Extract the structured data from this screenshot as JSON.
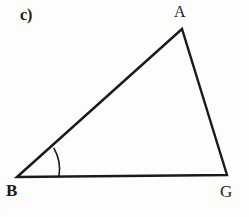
{
  "figure": {
    "part_label": "c)",
    "shape_name": "triangle",
    "background_color": "#fdfdfc",
    "stroke_color": "#1a1a1a",
    "stroke_width": 2.4,
    "arc_stroke_width": 1.6,
    "vertices": [
      {
        "name": "A",
        "label": "A",
        "x": 182,
        "y": 29
      },
      {
        "name": "B",
        "label": "B",
        "x": 17,
        "y": 177
      },
      {
        "name": "G",
        "label": "G",
        "x": 227,
        "y": 175
      }
    ],
    "sides": [
      {
        "name": "BA",
        "from": "B",
        "to": "A"
      },
      {
        "name": "AG",
        "from": "A",
        "to": "G"
      },
      {
        "name": "BG",
        "from": "B",
        "to": "G"
      }
    ],
    "angle_marks": [
      {
        "name": "angle-B",
        "at_vertex": "B",
        "radius": 42,
        "path": "M 58.9 176.5 A 42 42 0 0 0 54.0 148.4"
      }
    ],
    "labels": {
      "A": "A",
      "B": "B",
      "G": "G"
    },
    "triangle_path": "M 17 177 L 182 29 L 227 175 Z"
  }
}
